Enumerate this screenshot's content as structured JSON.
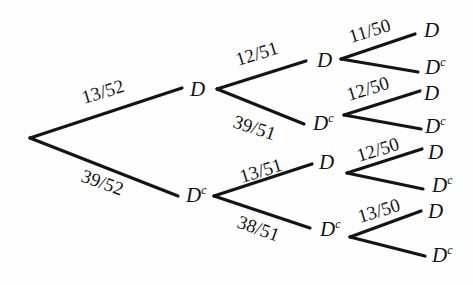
{
  "diagram": {
    "type": "probability-tree",
    "root": {
      "x": 30,
      "y": 138
    },
    "nodes": [
      {
        "id": "L1_D",
        "label": "D",
        "complement": false,
        "x": 187,
        "y": 89,
        "tx": 190,
        "ty": 96
      },
      {
        "id": "L1_Dc",
        "label": "D",
        "complement": true,
        "x": 182,
        "y": 196,
        "tx": 186,
        "ty": 202
      },
      {
        "id": "L2_DD",
        "label": "D",
        "complement": false,
        "x": 310,
        "y": 61,
        "tx": 317,
        "ty": 67
      },
      {
        "id": "L2_DDc",
        "label": "D",
        "complement": true,
        "x": 308,
        "y": 123,
        "tx": 313,
        "ty": 130
      },
      {
        "id": "L2_DcD",
        "label": "D",
        "complement": false,
        "x": 312,
        "y": 163,
        "tx": 319,
        "ty": 169
      },
      {
        "id": "L2_DcDc",
        "label": "D",
        "complement": true,
        "x": 310,
        "y": 228,
        "tx": 320,
        "ty": 236
      },
      {
        "id": "L3_1",
        "label": "D",
        "complement": false,
        "x": 415,
        "y": 33,
        "tx": 424,
        "ty": 37
      },
      {
        "id": "L3_2",
        "label": "D",
        "complement": true,
        "x": 417,
        "y": 70,
        "tx": 425,
        "ty": 74
      },
      {
        "id": "L3_3",
        "label": "D",
        "complement": false,
        "x": 418,
        "y": 90,
        "tx": 424,
        "ty": 100
      },
      {
        "id": "L3_4",
        "label": "D",
        "complement": true,
        "x": 420,
        "y": 128,
        "tx": 425,
        "ty": 133
      },
      {
        "id": "L3_5",
        "label": "D",
        "complement": false,
        "x": 422,
        "y": 148,
        "tx": 428,
        "ty": 159
      },
      {
        "id": "L3_6",
        "label": "D",
        "complement": true,
        "x": 424,
        "y": 188,
        "tx": 432,
        "ty": 192
      },
      {
        "id": "L3_7",
        "label": "D",
        "complement": false,
        "x": 420,
        "y": 210,
        "tx": 428,
        "ty": 218
      },
      {
        "id": "L3_8",
        "label": "D",
        "complement": true,
        "x": 424,
        "y": 255,
        "tx": 432,
        "ty": 262
      }
    ],
    "complement_superscript": "c",
    "edges": [
      {
        "from": "root",
        "fx": 30,
        "fy": 138,
        "tx": 182,
        "ty": 88,
        "prob": "13/52",
        "lx": 84,
        "ly": 104,
        "angle": -17
      },
      {
        "from": "root",
        "fx": 30,
        "fy": 138,
        "tx": 178,
        "ty": 196,
        "prob": "39/52",
        "lx": 80,
        "ly": 181,
        "angle": 20
      },
      {
        "from": "L1_D",
        "fx": 217,
        "fy": 89,
        "tx": 306,
        "ty": 61,
        "prob": "12/51",
        "lx": 238,
        "ly": 66,
        "angle": -17
      },
      {
        "from": "L1_D",
        "fx": 217,
        "fy": 89,
        "tx": 304,
        "ty": 124,
        "prob": "39/51",
        "lx": 232,
        "ly": 127,
        "angle": 18
      },
      {
        "from": "L1_Dc",
        "fx": 214,
        "fy": 196,
        "tx": 312,
        "ty": 164,
        "prob": "13/51",
        "lx": 242,
        "ly": 183,
        "angle": -17
      },
      {
        "from": "L1_Dc",
        "fx": 214,
        "fy": 196,
        "tx": 310,
        "ty": 228,
        "prob": "38/51",
        "lx": 236,
        "ly": 227,
        "angle": 20
      },
      {
        "from": "L2_DD",
        "fx": 341,
        "fy": 59,
        "tx": 415,
        "ty": 34,
        "prob": "11/50",
        "lx": 351,
        "ly": 43,
        "angle": -17
      },
      {
        "from": "L2_DD",
        "fx": 341,
        "fy": 59,
        "tx": 418,
        "ty": 72,
        "prob": "",
        "lx": 0,
        "ly": 0,
        "angle": 0
      },
      {
        "from": "L2_DDc",
        "fx": 344,
        "fy": 115,
        "tx": 420,
        "ty": 91,
        "prob": "12/50",
        "lx": 349,
        "ly": 101,
        "angle": -17
      },
      {
        "from": "L2_DDc",
        "fx": 344,
        "fy": 115,
        "tx": 421,
        "ty": 129,
        "prob": "",
        "lx": 0,
        "ly": 0,
        "angle": 0
      },
      {
        "from": "L2_DcD",
        "fx": 347,
        "fy": 173,
        "tx": 422,
        "ty": 149,
        "prob": "12/50",
        "lx": 359,
        "ly": 162,
        "angle": -17
      },
      {
        "from": "L2_DcD",
        "fx": 347,
        "fy": 173,
        "tx": 423,
        "ty": 189,
        "prob": "",
        "lx": 0,
        "ly": 0,
        "angle": 0
      },
      {
        "from": "L2_DcDc",
        "fx": 350,
        "fy": 237,
        "tx": 421,
        "ty": 211,
        "prob": "13/50",
        "lx": 360,
        "ly": 223,
        "angle": -17
      },
      {
        "from": "L2_DcDc",
        "fx": 350,
        "fy": 237,
        "tx": 425,
        "ty": 256,
        "prob": "",
        "lx": 0,
        "ly": 0,
        "angle": 0
      }
    ]
  }
}
